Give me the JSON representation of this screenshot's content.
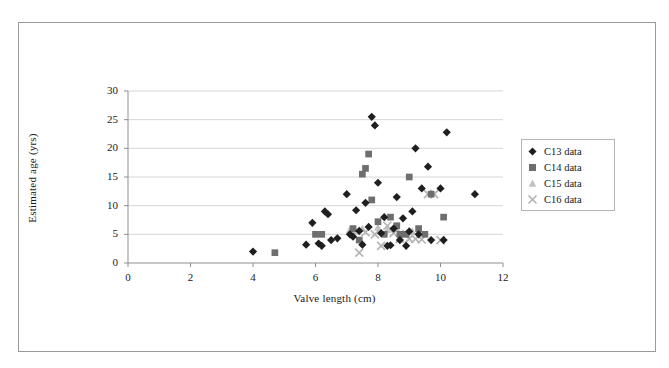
{
  "chart_data": {
    "type": "scatter",
    "title": "",
    "xlabel": "Valve length (cm)",
    "ylabel": "Estimated age (yrs)",
    "xlim": [
      0,
      12
    ],
    "ylim": [
      0,
      30
    ],
    "xticks": [
      0,
      2,
      4,
      6,
      8,
      10,
      12
    ],
    "yticks": [
      0,
      5,
      10,
      15,
      20,
      25,
      30
    ],
    "grid": "horizontal",
    "legend_position": "right",
    "series": [
      {
        "name": "C13 data",
        "marker": "diamond",
        "color": "#1f1f1f",
        "points": [
          [
            4.0,
            2.0
          ],
          [
            5.7,
            3.2
          ],
          [
            5.9,
            7.0
          ],
          [
            6.1,
            3.4
          ],
          [
            6.2,
            3.0
          ],
          [
            6.3,
            9.0
          ],
          [
            6.4,
            8.5
          ],
          [
            6.5,
            4.0
          ],
          [
            6.7,
            4.3
          ],
          [
            7.0,
            12.0
          ],
          [
            7.1,
            5.0
          ],
          [
            7.2,
            4.6
          ],
          [
            7.3,
            9.2
          ],
          [
            7.4,
            5.6
          ],
          [
            7.5,
            3.2
          ],
          [
            7.6,
            10.5
          ],
          [
            7.7,
            6.3
          ],
          [
            7.8,
            25.5
          ],
          [
            7.9,
            24.0
          ],
          [
            8.0,
            14.0
          ],
          [
            8.1,
            5.2
          ],
          [
            8.2,
            8.0
          ],
          [
            8.3,
            3.0
          ],
          [
            8.4,
            3.1
          ],
          [
            8.5,
            6.0
          ],
          [
            8.6,
            11.5
          ],
          [
            8.7,
            4.0
          ],
          [
            8.8,
            7.8
          ],
          [
            8.9,
            3.0
          ],
          [
            9.0,
            5.5
          ],
          [
            9.1,
            9.0
          ],
          [
            9.2,
            20.0
          ],
          [
            9.3,
            5.0
          ],
          [
            9.4,
            13.0
          ],
          [
            9.6,
            16.8
          ],
          [
            9.7,
            4.0
          ],
          [
            10.0,
            13.0
          ],
          [
            10.1,
            4.0
          ],
          [
            10.2,
            22.8
          ],
          [
            11.1,
            12.0
          ]
        ]
      },
      {
        "name": "C14 data",
        "marker": "square",
        "color": "#6e6e6e",
        "points": [
          [
            4.7,
            1.8
          ],
          [
            6.0,
            5.0
          ],
          [
            6.2,
            5.0
          ],
          [
            7.2,
            6.0
          ],
          [
            7.4,
            4.0
          ],
          [
            7.5,
            15.5
          ],
          [
            7.6,
            16.5
          ],
          [
            7.7,
            19.0
          ],
          [
            7.8,
            11.0
          ],
          [
            8.0,
            7.2
          ],
          [
            8.2,
            5.0
          ],
          [
            8.4,
            8.0
          ],
          [
            8.6,
            6.5
          ],
          [
            8.7,
            5.0
          ],
          [
            8.9,
            5.0
          ],
          [
            9.0,
            15.0
          ],
          [
            9.3,
            6.0
          ],
          [
            9.5,
            5.0
          ],
          [
            9.7,
            12.0
          ],
          [
            10.1,
            8.0
          ]
        ]
      },
      {
        "name": "C15 data",
        "marker": "triangle",
        "color": "#c2c2c2",
        "points": [
          [
            7.1,
            5.8
          ],
          [
            7.3,
            5.5
          ],
          [
            7.5,
            6.0
          ],
          [
            8.0,
            6.2
          ],
          [
            8.3,
            5.8
          ],
          [
            8.6,
            6.0
          ],
          [
            8.8,
            5.2
          ],
          [
            9.1,
            5.5
          ]
        ]
      },
      {
        "name": "C16 data",
        "marker": "cross",
        "color": "#b5b5b5",
        "points": [
          [
            7.4,
            1.8
          ],
          [
            7.6,
            5.4
          ],
          [
            7.9,
            5.0
          ],
          [
            8.1,
            3.0
          ],
          [
            8.3,
            6.5
          ],
          [
            8.5,
            5.2
          ],
          [
            8.7,
            4.2
          ],
          [
            9.0,
            4.2
          ],
          [
            9.2,
            4.2
          ],
          [
            9.4,
            4.1
          ],
          [
            9.6,
            12.0
          ],
          [
            9.8,
            12.0
          ],
          [
            10.0,
            4.0
          ]
        ]
      }
    ]
  },
  "legend": {
    "items": [
      {
        "label": "C13 data",
        "marker": "diamond",
        "color": "#1f1f1f"
      },
      {
        "label": "C14 data",
        "marker": "square",
        "color": "#6e6e6e"
      },
      {
        "label": "C15 data",
        "marker": "triangle",
        "color": "#c2c2c2"
      },
      {
        "label": "C16 data",
        "marker": "cross",
        "color": "#b5b5b5"
      }
    ]
  }
}
